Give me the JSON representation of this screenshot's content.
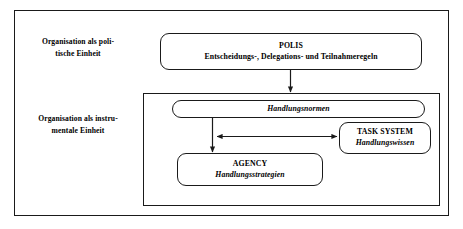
{
  "diagram": {
    "row_labels": [
      {
        "id": "political",
        "text": "Organisation als poli-\ntische Einheit"
      },
      {
        "id": "instrumental",
        "text": "Organisation als instru-\nmentale Einheit"
      }
    ],
    "boxes": [
      {
        "id": "polis",
        "title": "POLIS",
        "subtitle": "Entscheidungs-, Delegations- und Teilnahmeregeln"
      },
      {
        "id": "handlungsnormen",
        "title": "Handlungsnormen",
        "subtitle": ""
      },
      {
        "id": "task-system",
        "title": "TASK SYSTEM",
        "subtitle": "Handlungswissen"
      },
      {
        "id": "agency",
        "title": "AGENCY",
        "subtitle": "Handlungsstrategien"
      }
    ],
    "connectors": [
      {
        "id": "polis-to-inner-panel",
        "type": "arrow-down"
      },
      {
        "id": "handlungsnormen-to-agency",
        "type": "arrow-down"
      },
      {
        "id": "agency-task-system-link",
        "type": "arrow-double-horizontal"
      }
    ],
    "colors": {
      "stroke": "#1a1a1a",
      "background": "#ffffff",
      "text": "#000000"
    }
  }
}
